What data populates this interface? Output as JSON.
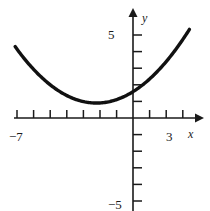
{
  "figure": {
    "title": "",
    "background_color": "#ffffff",
    "curve_color": "#111111",
    "axis_color": "#1a1a1a"
  },
  "axes": {
    "x_axis_label": "x",
    "y_axis_label": "y",
    "x_min_label": "−7",
    "x_max_label": "3",
    "y_max_label": "5",
    "y_min_label": "−5"
  },
  "chart_data": {
    "type": "line",
    "title": "",
    "subtitle": "",
    "xlabel": "x",
    "ylabel": "y",
    "xlim": [
      -7,
      3
    ],
    "ylim": [
      -5,
      5
    ],
    "xticks": [
      -7,
      -6,
      -5,
      -4,
      -3,
      -2,
      -1,
      0,
      1,
      2,
      3
    ],
    "yticks": [
      -5,
      -4,
      -3,
      -2,
      -1,
      0,
      1,
      2,
      3,
      4,
      5
    ],
    "xtick_labels": [
      "−7",
      "",
      "",
      "",
      "",
      "",
      "",
      "",
      "",
      "",
      "3"
    ],
    "ytick_labels": [
      "−5",
      "",
      "",
      "",
      "",
      "",
      "",
      "",
      "",
      "",
      "5"
    ],
    "grid": false,
    "legend": false,
    "legend_position": "none",
    "annotations": [],
    "series": [
      {
        "name": "parabola",
        "color": "#111111",
        "vertex": [
          -2.2,
          0.9
        ],
        "y_intercept": 1.8,
        "x": [
          -7.1,
          -6.6,
          -6.1,
          -5.6,
          -5.1,
          -4.6,
          -4.1,
          -3.6,
          -3.1,
          -2.6,
          -2.2,
          -1.8,
          -1.3,
          -0.8,
          -0.3,
          0.2,
          0.7,
          1.2,
          1.7,
          2.2,
          2.7,
          3.4
        ],
        "y": [
          4.3,
          3.63,
          3.02,
          2.47,
          1.98,
          1.55,
          1.18,
          0.87,
          0.62,
          0.43,
          0.9,
          0.35,
          0.48,
          0.87,
          1.32,
          1.83,
          2.4,
          3.03,
          3.72,
          4.47,
          5.28,
          4.5
        ]
      }
    ]
  }
}
